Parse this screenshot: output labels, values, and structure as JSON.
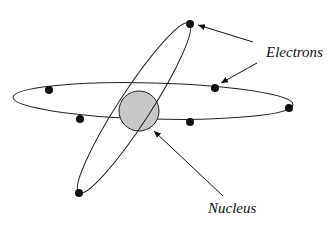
{
  "diagram": {
    "labels": {
      "electrons": "Electrons",
      "nucleus": "Nucleus"
    },
    "colors": {
      "nucleus_fill": "#c8c8c8",
      "stroke": "#222222",
      "electron": "#111111"
    },
    "nucleus": {
      "cx": 139,
      "cy": 111,
      "r": 20
    },
    "orbits": [
      {
        "name": "horizontal-orbit",
        "cx": 153,
        "cy": 101,
        "rx": 140,
        "ry": 18,
        "rotate": 1.5
      },
      {
        "name": "tilted-orbit",
        "cx": 134,
        "cy": 108,
        "rx": 100,
        "ry": 17,
        "rotate": -57
      }
    ],
    "electrons": [
      {
        "x": 190,
        "y": 24
      },
      {
        "x": 79,
        "y": 193
      },
      {
        "x": 49,
        "y": 90
      },
      {
        "x": 215,
        "y": 88
      },
      {
        "x": 289,
        "y": 108
      },
      {
        "x": 80,
        "y": 119
      },
      {
        "x": 190,
        "y": 122
      }
    ]
  }
}
